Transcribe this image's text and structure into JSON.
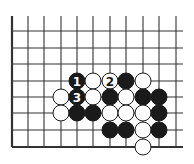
{
  "board": {
    "columns_x": [
      12,
      28,
      44,
      61,
      77,
      93,
      110,
      126,
      143,
      159,
      176
    ],
    "rows_y": [
      31,
      48,
      64,
      81,
      97,
      113,
      130,
      147
    ],
    "line_top": 16,
    "line_right": 183,
    "left_edge": true,
    "bottom_edge": true,
    "line_color": "#333333",
    "stone_radius": 8
  },
  "stones": [
    {
      "color": "black",
      "col": 4,
      "row": 3,
      "label": "1"
    },
    {
      "color": "white",
      "col": 5,
      "row": 3,
      "label": ""
    },
    {
      "color": "white",
      "col": 6,
      "row": 3,
      "label": "2"
    },
    {
      "color": "black",
      "col": 7,
      "row": 3,
      "label": ""
    },
    {
      "color": "white",
      "col": 8,
      "row": 3,
      "label": ""
    },
    {
      "color": "white",
      "col": 3,
      "row": 4,
      "label": ""
    },
    {
      "color": "black",
      "col": 4,
      "row": 4,
      "label": "3"
    },
    {
      "color": "white",
      "col": 5,
      "row": 4,
      "label": ""
    },
    {
      "color": "black",
      "col": 6,
      "row": 4,
      "label": ""
    },
    {
      "color": "white",
      "col": 7,
      "row": 4,
      "label": ""
    },
    {
      "color": "black",
      "col": 8,
      "row": 4,
      "label": ""
    },
    {
      "color": "black",
      "col": 9,
      "row": 4,
      "label": ""
    },
    {
      "color": "white",
      "col": 3,
      "row": 5,
      "label": ""
    },
    {
      "color": "black",
      "col": 4,
      "row": 5,
      "label": ""
    },
    {
      "color": "black",
      "col": 5,
      "row": 5,
      "label": ""
    },
    {
      "color": "white",
      "col": 6,
      "row": 5,
      "label": ""
    },
    {
      "color": "white",
      "col": 7,
      "row": 5,
      "label": ""
    },
    {
      "color": "white",
      "col": 8,
      "row": 5,
      "label": ""
    },
    {
      "color": "black",
      "col": 9,
      "row": 5,
      "label": ""
    },
    {
      "color": "black",
      "col": 6,
      "row": 6,
      "label": ""
    },
    {
      "color": "black",
      "col": 7,
      "row": 6,
      "label": ""
    },
    {
      "color": "white",
      "col": 8,
      "row": 6,
      "label": ""
    },
    {
      "color": "black",
      "col": 9,
      "row": 6,
      "label": ""
    },
    {
      "color": "white",
      "col": 8,
      "row": 7,
      "label": ""
    }
  ]
}
